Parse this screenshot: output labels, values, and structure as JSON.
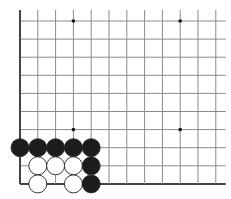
{
  "board": {
    "grid": {
      "x0": 20,
      "y0": 21,
      "dx": 17.8,
      "dy": 18.1,
      "cols": 12,
      "rows": 10,
      "extend_right": 10,
      "extend_top": 11,
      "line_color": "#8a8a8a",
      "edge_color": "#444444"
    },
    "edges": [
      "left",
      "bottom"
    ],
    "star_points": [
      {
        "col": 3,
        "row": 0
      },
      {
        "col": 9,
        "row": 0
      },
      {
        "col": 3,
        "row": 6
      },
      {
        "col": 9,
        "row": 6
      }
    ],
    "stone_radius": 9,
    "stones": [
      {
        "color": "black",
        "col": 0,
        "row": 7
      },
      {
        "color": "black",
        "col": 1,
        "row": 7
      },
      {
        "color": "black",
        "col": 2,
        "row": 7
      },
      {
        "color": "black",
        "col": 3,
        "row": 7
      },
      {
        "color": "black",
        "col": 4,
        "row": 7
      },
      {
        "color": "white",
        "col": 1,
        "row": 8
      },
      {
        "color": "white",
        "col": 2,
        "row": 8
      },
      {
        "color": "white",
        "col": 3,
        "row": 8
      },
      {
        "color": "black",
        "col": 4,
        "row": 8
      },
      {
        "color": "white",
        "col": 1,
        "row": 9
      },
      {
        "color": "white",
        "col": 3,
        "row": 9
      },
      {
        "color": "black",
        "col": 4,
        "row": 9
      }
    ],
    "colors": {
      "black_stone": "#1c1c1c",
      "white_stone": "#ffffff",
      "stone_outline": "#222222",
      "background": "#ffffff"
    }
  }
}
